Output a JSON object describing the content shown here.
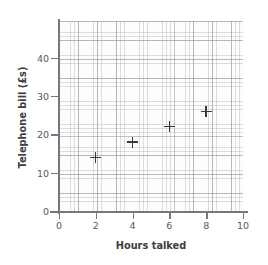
{
  "chart_data": {
    "type": "scatter",
    "title": "",
    "xlabel": "Hours talked",
    "ylabel": "Telephone bill (£s)",
    "xlim": [
      0,
      10
    ],
    "ylim": [
      0,
      50
    ],
    "xticks": [
      "0",
      "2",
      "4",
      "6",
      "8",
      "10"
    ],
    "xtick_values": [
      0,
      2,
      4,
      6,
      8,
      10
    ],
    "yticks": [
      "0",
      "10",
      "20",
      "30",
      "40"
    ],
    "ytick_values": [
      0,
      10,
      20,
      30,
      40
    ],
    "grid": true,
    "grid_style": "graph-paper",
    "legend": "none",
    "marker": "plus",
    "x": [
      2,
      4,
      6,
      8
    ],
    "values": [
      14,
      18,
      22,
      26
    ],
    "points": [
      {
        "x": 2,
        "y": 14
      },
      {
        "x": 4,
        "y": 18
      },
      {
        "x": 6,
        "y": 22
      },
      {
        "x": 8,
        "y": 26
      }
    ],
    "colors": {
      "marker": "#3a3a3e",
      "axis": "#77777d",
      "grid_major": "#96969e",
      "grid_minor": "#afafb9",
      "text": "#3d3d42",
      "tick_text": "#58585c",
      "background": "#ffffff"
    }
  }
}
